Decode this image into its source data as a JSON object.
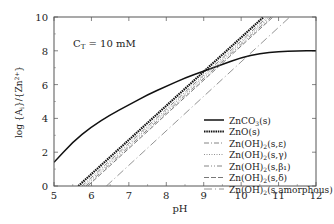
{
  "chart_data": {
    "type": "line",
    "title": "",
    "annotation": "C_T = 10 mM",
    "xlabel": "pH",
    "ylabel": "log {A}_i/{Zn2+}",
    "xlim": [
      5,
      12
    ],
    "ylim": [
      0,
      10
    ],
    "xticks": [
      5,
      6,
      7,
      8,
      9,
      10,
      11,
      12
    ],
    "yticks": [
      0,
      2,
      4,
      6,
      8,
      10
    ],
    "grid": false,
    "legend_position": "lower right",
    "series": [
      {
        "name": "ZnCO3(s)",
        "style": "solid-thick",
        "x": [
          5,
          5.5,
          6,
          6.5,
          7,
          7.5,
          8,
          8.5,
          9,
          9.5,
          10,
          10.5,
          11,
          11.5,
          12
        ],
        "y": [
          1.4,
          2.6,
          3.5,
          4.2,
          4.8,
          5.4,
          5.9,
          6.4,
          6.8,
          7.2,
          7.6,
          7.85,
          7.95,
          8.0,
          8.0
        ]
      },
      {
        "name": "ZnO(s)",
        "style": "dotted-thick",
        "x": [
          5.65,
          10.6
        ],
        "y": [
          0,
          10
        ]
      },
      {
        "name": "Zn(OH)2(s,ε)",
        "style": "dash-dot",
        "x": [
          5.75,
          10.7
        ],
        "y": [
          0,
          10
        ]
      },
      {
        "name": "Zn(OH)2(s,γ)",
        "style": "dotted",
        "x": [
          5.8,
          10.75
        ],
        "y": [
          0,
          10
        ]
      },
      {
        "name": "Zn(OH)2(s,β1)",
        "style": "dash-dot-dot",
        "x": [
          5.85,
          10.8
        ],
        "y": [
          0,
          10
        ]
      },
      {
        "name": "Zn(OH)2(s,δ)",
        "style": "dashed",
        "x": [
          5.9,
          10.85
        ],
        "y": [
          0,
          10
        ]
      },
      {
        "name": "Zn(OH)2(s,amorphous)",
        "style": "long-dash-dot",
        "x": [
          6.4,
          11.3
        ],
        "y": [
          0,
          10
        ]
      }
    ]
  },
  "labels": {
    "annotation": "C",
    "annotation_sub": "T",
    "annotation_val": " = 10 mM",
    "xlabel": "pH",
    "ylabel": "log {A",
    "legend": [
      {
        "pre": "ZnCO",
        "sub": "3",
        "post": "(s)"
      },
      {
        "pre": "ZnO(s)",
        "sub": "",
        "post": ""
      },
      {
        "pre": "Zn(OH)",
        "sub": "2",
        "post": "(s,ε)"
      },
      {
        "pre": "Zn(OH)",
        "sub": "2",
        "post": "(s,γ)"
      },
      {
        "pre": "Zn(OH)",
        "sub": "2",
        "post": "(s,β₁)"
      },
      {
        "pre": "Zn(OH)",
        "sub": "2",
        "post": "(s,δ)"
      },
      {
        "pre": "Zn(OH)",
        "sub": "2",
        "post": "(s,amorphous)"
      }
    ]
  }
}
